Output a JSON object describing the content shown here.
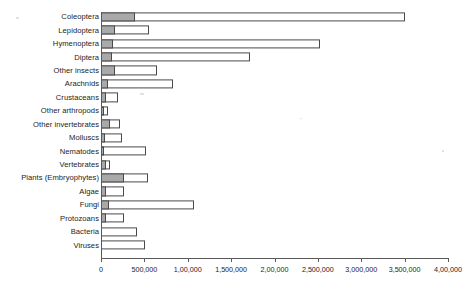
{
  "chart_data": {
    "type": "bar",
    "orientation": "horizontal",
    "stacked": true,
    "title": "",
    "subtitle": "",
    "xlabel": "",
    "ylabel": "",
    "xlim": [
      0,
      4000000
    ],
    "grid": false,
    "legend_position": "none",
    "colors": {
      "described": "#a9a9a9",
      "estimated": "#ffffff",
      "outline": "#4a4a4a",
      "axis": "#5a5a5a",
      "text": "#1c1c1c"
    },
    "categories": [
      "Coleoptera",
      "Lepidoptera",
      "Hymenoptera",
      "Diptera",
      "Other  insects",
      "Arachnids",
      "Crustaceans",
      "Other arthropods",
      "Other invertebrates",
      "Molluscs",
      "Nematodes",
      "Vertebrates",
      "Plants (Embryophytes)",
      "Algae",
      "Fungi",
      "Protozoans",
      "Bacteria",
      "Viruses"
    ],
    "series": [
      {
        "name": "Described species",
        "values": [
          390000,
          160000,
          140000,
          125000,
          160000,
          80000,
          55000,
          30000,
          105000,
          50000,
          30000,
          55000,
          260000,
          55000,
          90000,
          55000,
          0,
          0
        ]
      },
      {
        "name": "Estimated total species",
        "values": [
          3500000,
          550000,
          2530000,
          1720000,
          640000,
          830000,
          195000,
          80000,
          220000,
          240000,
          520000,
          105000,
          540000,
          260000,
          1070000,
          270000,
          420000,
          510000
        ]
      }
    ],
    "tick_values": [
      0,
      500000,
      1000000,
      1500000,
      2000000,
      2500000,
      3000000,
      3500000,
      4000000
    ],
    "tick_labels": [
      "0",
      "500,000",
      "1,00,000",
      "1,500,000",
      "2,00,000",
      "2,500,000",
      "3,000,000",
      "3,500,000",
      "4,00,000"
    ]
  }
}
